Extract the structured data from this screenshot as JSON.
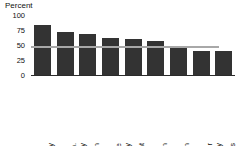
{
  "chart_data": {
    "type": "bar",
    "title": "",
    "subtitle": "",
    "xlabel": "",
    "ylabel": "Percent",
    "ylim": [
      0,
      100
    ],
    "yticks": [
      0,
      25,
      50,
      75,
      100
    ],
    "ytick_labels": [
      "0",
      "25",
      "50",
      "75",
      "100"
    ],
    "grid": false,
    "legend": false,
    "legend_position": "none",
    "bar_color": "#333333",
    "reference_line": {
      "value": 50,
      "color": "#a8a8a8",
      "label": ""
    },
    "categories": [
      "Demography",
      "Econ.\ncomplexity",
      "Urbanization",
      "Income\nequality",
      "Investment",
      "Education",
      "Innovation",
      "Gender\nequality",
      "Institutions"
    ],
    "values": [
      85,
      74,
      70,
      64,
      61,
      58,
      50,
      42,
      41
    ]
  }
}
